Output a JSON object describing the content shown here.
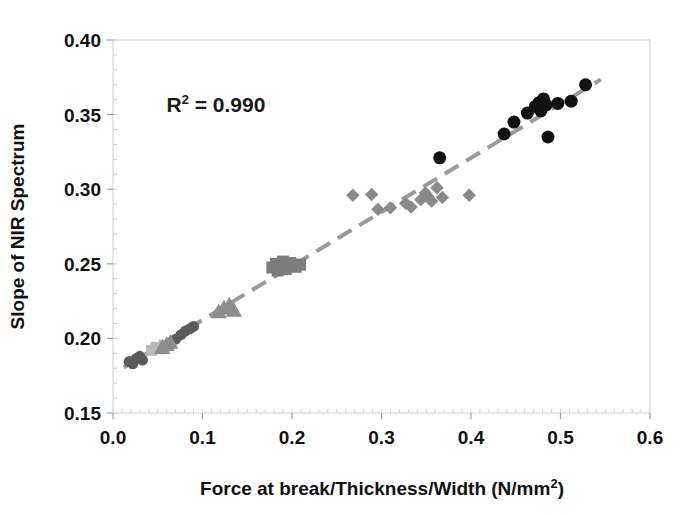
{
  "figure": {
    "top_bleed_text": "·",
    "background_color": "#ffffff"
  },
  "chart_data": {
    "type": "scatter",
    "title": "",
    "xlabel": "Force at break/Thickness/Width (N/mm2)",
    "xlabel_main": "Force at break/Thickness/Width (N/mm",
    "xlabel_sup": "2",
    "xlabel_tail": ")",
    "ylabel": "Slope of NIR Spectrum",
    "xlim": [
      0.0,
      0.6
    ],
    "ylim": [
      0.15,
      0.4
    ],
    "xticks": [
      0.0,
      0.1,
      0.2,
      0.3,
      0.4,
      0.5,
      0.6
    ],
    "xtick_labels": [
      "0.0",
      "0.1",
      "0.2",
      "0.3",
      "0.4",
      "0.5",
      "0.6"
    ],
    "yticks": [
      0.15,
      0.2,
      0.25,
      0.3,
      0.35,
      0.4
    ],
    "ytick_labels": [
      "0.15",
      "0.20",
      "0.25",
      "0.30",
      "0.35",
      "0.40"
    ],
    "grid": false,
    "legend": "none",
    "annotations": [
      {
        "name": "r-squared",
        "text": "R2 = 0.990",
        "text_main": "R",
        "text_sup": "2",
        "text_tail": " = 0.990",
        "x": 0.115,
        "y": 0.352
      }
    ],
    "trendline": {
      "name": "linear-fit-dashed",
      "style": "dashed",
      "color": "#9a9a9a",
      "width": 4,
      "dash": "16,9",
      "x_start": 0.012,
      "y_start": 0.1805,
      "x_end": 0.545,
      "y_end": 0.3735
    },
    "series": [
      {
        "name": "Group A",
        "marker": "circle",
        "color": "#5b5b5b",
        "size": 11,
        "points": [
          {
            "x": 0.018,
            "y": 0.1845
          },
          {
            "x": 0.022,
            "y": 0.183
          },
          {
            "x": 0.026,
            "y": 0.1865
          },
          {
            "x": 0.03,
            "y": 0.188
          },
          {
            "x": 0.033,
            "y": 0.1855
          },
          {
            "x": 0.07,
            "y": 0.1995
          },
          {
            "x": 0.076,
            "y": 0.2025
          },
          {
            "x": 0.081,
            "y": 0.205
          },
          {
            "x": 0.086,
            "y": 0.2065
          },
          {
            "x": 0.09,
            "y": 0.208
          }
        ]
      },
      {
        "name": "Group B",
        "marker": "square",
        "color": "#b9b9b9",
        "size": 11,
        "points": [
          {
            "x": 0.043,
            "y": 0.192
          },
          {
            "x": 0.048,
            "y": 0.194
          },
          {
            "x": 0.053,
            "y": 0.193
          },
          {
            "x": 0.057,
            "y": 0.1955
          }
        ]
      },
      {
        "name": "Group C",
        "marker": "triangle",
        "color": "#8d8d8d",
        "size": 13,
        "points": [
          {
            "x": 0.055,
            "y": 0.194
          },
          {
            "x": 0.06,
            "y": 0.196
          },
          {
            "x": 0.064,
            "y": 0.1975
          },
          {
            "x": 0.118,
            "y": 0.218
          },
          {
            "x": 0.124,
            "y": 0.2205
          },
          {
            "x": 0.13,
            "y": 0.2225
          },
          {
            "x": 0.135,
            "y": 0.219
          }
        ]
      },
      {
        "name": "Group D",
        "marker": "square",
        "color": "#7d7d7d",
        "size": 12,
        "points": [
          {
            "x": 0.178,
            "y": 0.2475
          },
          {
            "x": 0.182,
            "y": 0.25
          },
          {
            "x": 0.184,
            "y": 0.2455
          },
          {
            "x": 0.187,
            "y": 0.249
          },
          {
            "x": 0.19,
            "y": 0.2515
          },
          {
            "x": 0.193,
            "y": 0.2465
          },
          {
            "x": 0.198,
            "y": 0.2505
          },
          {
            "x": 0.204,
            "y": 0.248
          },
          {
            "x": 0.209,
            "y": 0.2495
          }
        ]
      },
      {
        "name": "Group E",
        "marker": "diamond",
        "color": "#8a8a8a",
        "size": 11,
        "points": [
          {
            "x": 0.268,
            "y": 0.296
          },
          {
            "x": 0.289,
            "y": 0.2965
          },
          {
            "x": 0.296,
            "y": 0.2865
          },
          {
            "x": 0.31,
            "y": 0.2875
          },
          {
            "x": 0.327,
            "y": 0.2905
          },
          {
            "x": 0.333,
            "y": 0.288
          },
          {
            "x": 0.344,
            "y": 0.293
          },
          {
            "x": 0.349,
            "y": 0.2975
          },
          {
            "x": 0.352,
            "y": 0.295
          },
          {
            "x": 0.356,
            "y": 0.292
          },
          {
            "x": 0.362,
            "y": 0.301
          },
          {
            "x": 0.368,
            "y": 0.2945
          },
          {
            "x": 0.398,
            "y": 0.296
          }
        ]
      },
      {
        "name": "Group F",
        "marker": "circle",
        "color": "#111111",
        "size": 13,
        "points": [
          {
            "x": 0.365,
            "y": 0.321
          },
          {
            "x": 0.437,
            "y": 0.337
          },
          {
            "x": 0.448,
            "y": 0.345
          },
          {
            "x": 0.463,
            "y": 0.351
          },
          {
            "x": 0.472,
            "y": 0.3555
          },
          {
            "x": 0.476,
            "y": 0.358
          },
          {
            "x": 0.478,
            "y": 0.3525
          },
          {
            "x": 0.481,
            "y": 0.3605
          },
          {
            "x": 0.484,
            "y": 0.3565
          },
          {
            "x": 0.486,
            "y": 0.335
          },
          {
            "x": 0.497,
            "y": 0.3575
          },
          {
            "x": 0.512,
            "y": 0.359
          },
          {
            "x": 0.528,
            "y": 0.37
          }
        ]
      }
    ]
  }
}
